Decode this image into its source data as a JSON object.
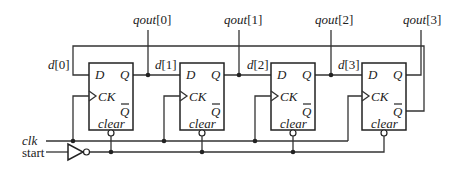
{
  "diagram": {
    "outputs": [
      "qout[0]",
      "qout[1]",
      "qout[2]",
      "qout[3]"
    ],
    "d_labels": [
      "d[0]",
      "d[1]",
      "d[2]",
      "d[3]"
    ],
    "flipflop": {
      "d": "D",
      "q": "Q",
      "ck": "CK",
      "qbar": "Q",
      "clear": "clear"
    },
    "inputs": {
      "clk": "clk",
      "start": "start"
    }
  }
}
